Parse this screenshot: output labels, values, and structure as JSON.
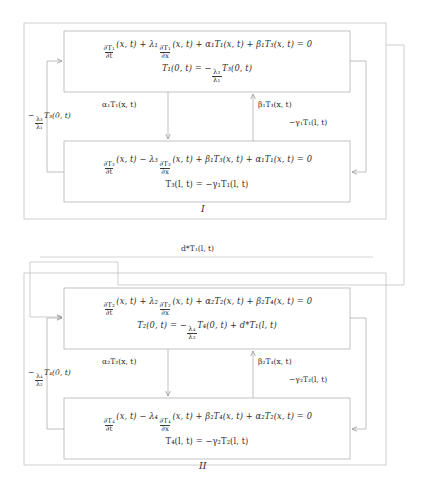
{
  "figure": {
    "type": "block-diagram",
    "line_color": "#8d8d8d",
    "text_color": "#2e2e2e",
    "background": "#ffffff"
  },
  "blocks": [
    {
      "id": "I",
      "label": "I",
      "top_box": {
        "name": "T1-subsystem",
        "pde": {
          "d_num": "∂T₁",
          "d_den": "∂t",
          "args1": "(x, t) + ",
          "lambda": "λ₁",
          "d2_num": "∂T₁",
          "d2_den": "∂x",
          "args2": "(x, t) + ",
          "alpha": "α₁",
          "alpha_term": "T₁(x, t) + ",
          "beta": "β₁",
          "beta_term": "T₃(x, t) = 0"
        },
        "boundary": {
          "lhs": "T₁(0, t) = −",
          "frac_num": "λ₃",
          "frac_den": "λ₁",
          "rhs": "T₃(0, t)"
        }
      },
      "bottom_box": {
        "name": "T3-subsystem",
        "pde": {
          "d_num": "∂T₃",
          "d_den": "∂t",
          "args1": "(x, t) − ",
          "lambda": "λ₃",
          "d2_num": "∂T₃",
          "d2_den": "∂x",
          "args2": "(x, t) + ",
          "alpha": "β₁",
          "alpha_term": "T₃(x, t) + ",
          "beta": "α₁",
          "beta_term": "T₁(x, t) = 0"
        },
        "boundary": {
          "lhs": "T₃(l, t) = −γ₁T₁(l, t)"
        }
      },
      "signals": {
        "left": {
          "prefix": "−",
          "frac_num": "λ₃",
          "frac_den": "λ₁",
          "term": "T₃(0, t)"
        },
        "inner_left": "α₁T₁(x, t)",
        "inner_right": "β₁T₃(x, t)",
        "right": "−γ₁T₁(l, t)"
      }
    },
    {
      "id": "II",
      "label": "II",
      "top_box": {
        "name": "T2-subsystem",
        "pde": {
          "d_num": "∂T₂",
          "d_den": "∂t",
          "args1": "(x, t) + ",
          "lambda": "λ₂",
          "d2_num": "∂T₂",
          "d2_den": "∂x",
          "args2": "(x, t) + ",
          "alpha": "α₂",
          "alpha_term": "T₂(x, t) + ",
          "beta": "β₂",
          "beta_term": "T₄(x, t) = 0"
        },
        "boundary": {
          "lhs": "T₂(0, t) = −",
          "frac_num": "λ₄",
          "frac_den": "λ₂",
          "rhs": "T₄(0, t) + d*T₁(l, t)"
        }
      },
      "bottom_box": {
        "name": "T4-subsystem",
        "pde": {
          "d_num": "∂T₄",
          "d_den": "∂t",
          "args1": "(x, t) − ",
          "lambda": "λ₄",
          "d2_num": "∂T₄",
          "d2_den": "∂x",
          "args2": "(x, t) + ",
          "alpha": "β₂",
          "alpha_term": "T₄(x, t) + ",
          "beta": "α₂",
          "beta_term": "T₂(x, t) = 0"
        },
        "boundary": {
          "lhs": "T₄(l, t) = −γ₂T₂(l, t)"
        }
      },
      "signals": {
        "left": {
          "prefix": "−",
          "frac_num": "λ₄",
          "frac_den": "λ₂",
          "term": "T₄(0, t)"
        },
        "inner_left": "α₂T₂(x, t)",
        "inner_right": "β₂T₄(x, t)",
        "right": "−γ₂T₂(l, t)"
      }
    }
  ],
  "interconnect": {
    "name": "block-I-to-block-II-signal",
    "label": "d*T₁(l, t)"
  }
}
